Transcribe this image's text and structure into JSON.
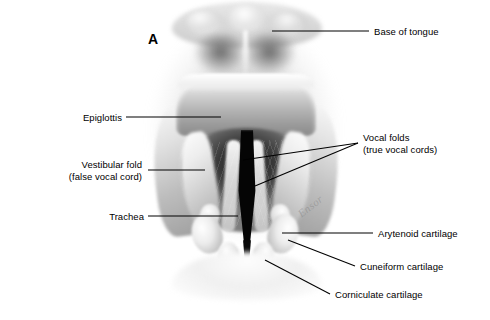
{
  "figure": {
    "panel_letter": "A",
    "watermark_text": "Ensor",
    "background_color": "#ffffff",
    "leader_line_color": "#000000",
    "label_text_color": "#000000"
  },
  "labels": {
    "base_of_tongue": "Base of tongue",
    "epiglottis": "Epiglottis",
    "vestibular_fold_line1": "Vestibular fold",
    "vestibular_fold_line2": "(false vocal cord)",
    "trachea": "Trachea",
    "vocal_folds_line1": "Vocal folds",
    "vocal_folds_line2": "(true vocal cords)",
    "arytenoid_cartilage": "Arytenoid cartilage",
    "cuneiform_cartilage": "Cuneiform cartilage",
    "corniculate_cartilage": "Corniculate cartilage"
  },
  "structures": [
    "base-of-tongue",
    "epiglottis",
    "vestibular-fold",
    "vocal-folds",
    "trachea",
    "arytenoid-cartilage",
    "cuneiform-cartilage",
    "corniculate-cartilage",
    "glottis"
  ]
}
